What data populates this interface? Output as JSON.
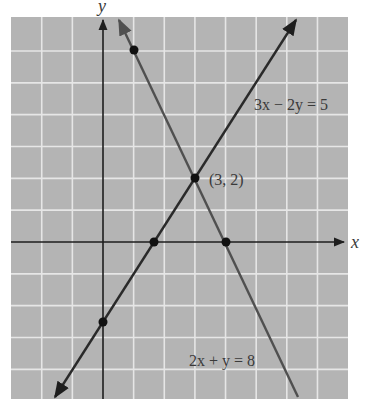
{
  "chart_data": {
    "type": "line",
    "title": "",
    "xlabel": "x",
    "ylabel": "y",
    "xlim": [
      -3,
      8
    ],
    "ylim": [
      -5,
      7
    ],
    "grid": true,
    "series": [
      {
        "name": "3x − 2y = 5",
        "equation": "3x - 2y = 5",
        "slope": 1.5,
        "intercept": -2.5,
        "points": [
          [
            0,
            -2.5
          ],
          [
            1.6667,
            0
          ],
          [
            3,
            2
          ]
        ]
      },
      {
        "name": "2x + y = 8",
        "equation": "2x + y = 8",
        "slope": -2,
        "intercept": 8,
        "points": [
          [
            1,
            6
          ],
          [
            4,
            0
          ],
          [
            3,
            2
          ]
        ]
      }
    ],
    "annotations": [
      {
        "text": "(3, 2)",
        "x": 3,
        "y": 2,
        "note": "intersection point"
      }
    ]
  },
  "labels": {
    "x_axis": "x",
    "y_axis": "y",
    "line1": "3x − 2y = 5",
    "line2": "2x + y = 8",
    "intersection": "(3, 2)"
  },
  "colors": {
    "grid_bg": "#b4b4b4",
    "grid_line": "#e6e6e6",
    "axis": "#1e1e1e",
    "line1": "#2a2a2a",
    "line2": "#505050",
    "text": "#3a3a3a"
  }
}
